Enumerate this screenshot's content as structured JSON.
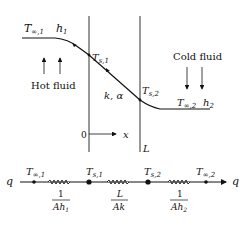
{
  "top": {
    "left_labels": {
      "T": "T",
      "T_sub": "∞,1",
      "h": "h",
      "h_sub": "1"
    },
    "hot_fluid": "Hot fluid",
    "cold_fluid": "Cold fluid",
    "ts1": {
      "T": "T",
      "sub": "s,1"
    },
    "ts2": {
      "T": "T",
      "sub": "s,2"
    },
    "wall_props": "k, α",
    "right_labels": {
      "T": "T",
      "T_sub": "∞,2",
      "h": "h",
      "h_sub": "2"
    },
    "origin": "0",
    "x_axis": "x",
    "L": "L"
  },
  "circuit": {
    "q_left": "q",
    "q_right": "q",
    "nodes": [
      {
        "T": "T",
        "sub": "∞,1"
      },
      {
        "T": "T",
        "sub": "s,1"
      },
      {
        "T": "T",
        "sub": "s,2"
      },
      {
        "T": "T",
        "sub": "∞,2"
      }
    ],
    "resistors": [
      {
        "num": "1",
        "den": "Ah",
        "den_sub": "1"
      },
      {
        "num": "L",
        "den": "Ak",
        "den_sub": ""
      },
      {
        "num": "1",
        "den": "Ah",
        "den_sub": "2"
      }
    ]
  }
}
